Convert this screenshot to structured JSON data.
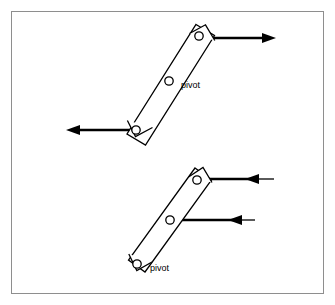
{
  "figure": {
    "frame": {
      "x": 11,
      "y": 11,
      "width": 313,
      "height": 283,
      "border_color": "#8e8e8e"
    },
    "stroke_color": "#000000",
    "fill_color": "#ffffff",
    "background_color": "#ffffff"
  },
  "diagrams": [
    {
      "id": "upper-assembly",
      "label": "upper bar with pivot",
      "bar": {
        "name": "upper-bar",
        "outline_points": "197,24 215,34 145,145 127,135",
        "end_cap_top": "190,33 206,25 215,41",
        "end_cap_bottom": "128,120 136,136 152,128"
      },
      "holes": [
        {
          "name": "upper-bar-top-hole",
          "cx": 199,
          "cy": 36,
          "r": 4.2
        },
        {
          "name": "upper-bar-pivot-hole",
          "cx": 169,
          "cy": 81,
          "r": 4.2
        },
        {
          "name": "upper-bar-bottom-hole",
          "cx": 136,
          "cy": 130,
          "r": 4.2
        }
      ],
      "pivot_label": {
        "name": "upper-pivot-label",
        "text": "pivot",
        "x": 181,
        "y": 88
      },
      "forces": [
        {
          "name": "upper-top-force-arrow",
          "direction": "right",
          "tail_x": 204,
          "head_x": 276,
          "y": 38
        },
        {
          "name": "upper-bottom-force-arrow",
          "direction": "left",
          "tail_x": 138,
          "head_x": 66,
          "y": 130
        }
      ]
    },
    {
      "id": "lower-assembly",
      "label": "lower bar with pivot",
      "bar": {
        "name": "lower-bar",
        "outline_points": "196,168 212,180 145,272 129,260",
        "end_cap_top": "189,177 203,168 212,183",
        "end_cap_bottom": "129,254 137,270 152,262"
      },
      "holes": [
        {
          "name": "lower-bar-top-hole",
          "cx": 197,
          "cy": 180,
          "r": 4.2
        },
        {
          "name": "lower-bar-middle-hole",
          "cx": 170,
          "cy": 220,
          "r": 4.2
        },
        {
          "name": "lower-bar-pivot-hole",
          "cx": 137,
          "cy": 264,
          "r": 4.2
        }
      ],
      "pivot_label": {
        "name": "lower-pivot-label",
        "text": "pivot",
        "x": 150,
        "y": 271
      },
      "forces": [
        {
          "name": "lower-top-force-arrow",
          "direction": "left",
          "tail_x": 274,
          "head_x": 245,
          "line_end_x": 202,
          "y": 179
        },
        {
          "name": "lower-middle-force-arrow",
          "direction": "left",
          "tail_x": 255,
          "head_x": 228,
          "line_end_x": 172,
          "y": 220
        }
      ]
    }
  ]
}
